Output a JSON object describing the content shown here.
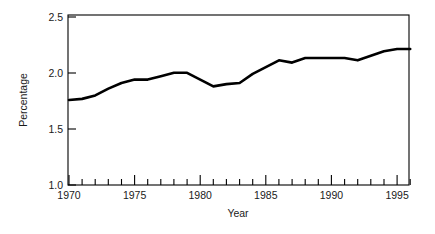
{
  "chart_data": {
    "type": "line",
    "title": "",
    "xlabel": "Year",
    "ylabel": "Percentage",
    "xlim": [
      1970,
      1996
    ],
    "ylim": [
      1.0,
      2.5
    ],
    "grid": false,
    "legend": null,
    "line_color": "#000000",
    "background_color": "#ffffff",
    "x_tick_labels": [
      "1970",
      "1975",
      "1980",
      "1985",
      "1990",
      "1995"
    ],
    "x_major_ticks": [
      1970,
      1975,
      1980,
      1985,
      1990,
      1995
    ],
    "x_minor_ticks": [
      1971,
      1972,
      1973,
      1974,
      1976,
      1977,
      1978,
      1979,
      1981,
      1982,
      1983,
      1984,
      1986,
      1987,
      1988,
      1989,
      1991,
      1992,
      1993,
      1994,
      1996
    ],
    "y_tick_labels": [
      "1.0",
      "1.5",
      "2.0",
      "2.5"
    ],
    "y_ticks": [
      1.0,
      1.5,
      2.0,
      2.5
    ],
    "x": [
      1970,
      1971,
      1972,
      1973,
      1974,
      1975,
      1976,
      1977,
      1978,
      1979,
      1980,
      1981,
      1982,
      1983,
      1984,
      1985,
      1986,
      1987,
      1988,
      1989,
      1990,
      1991,
      1992,
      1993,
      1994,
      1995,
      1996
    ],
    "values": [
      1.75,
      1.76,
      1.79,
      1.85,
      1.9,
      1.93,
      1.93,
      1.96,
      1.99,
      1.99,
      1.93,
      1.87,
      1.89,
      1.9,
      1.98,
      2.04,
      2.1,
      2.08,
      2.12,
      2.12,
      2.12,
      2.12,
      2.1,
      2.14,
      2.18,
      2.2,
      2.2
    ],
    "series": [
      {
        "name": "Percentage",
        "values": [
          1.75,
          1.76,
          1.79,
          1.85,
          1.9,
          1.93,
          1.93,
          1.96,
          1.99,
          1.99,
          1.93,
          1.87,
          1.89,
          1.9,
          1.98,
          2.04,
          2.1,
          2.08,
          2.12,
          2.12,
          2.12,
          2.12,
          2.1,
          2.14,
          2.18,
          2.2,
          2.2
        ]
      }
    ]
  },
  "axis": {
    "y_title": "Percentage",
    "x_title": "Year",
    "y_labels": [
      "2.5",
      "2.0",
      "1.5",
      "1.0"
    ],
    "x_labels": [
      "1970",
      "1975",
      "1980",
      "1985",
      "1990",
      "1995"
    ]
  }
}
